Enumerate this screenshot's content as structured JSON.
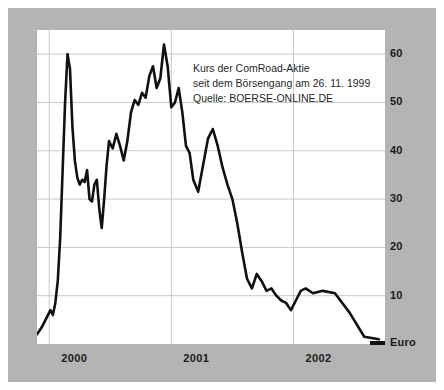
{
  "figure": {
    "frame_color": "#b4b4b4",
    "plot_bg": "#ffffff",
    "line_color": "#111111",
    "grid_color": "#c9c9c9"
  },
  "annotation": {
    "line1": "Kurs der ComRoad-Aktie",
    "line2": "seit dem Börsengang am 26. 11. 1999",
    "line3": "Quelle: BOERSE-ONLINE.DE"
  },
  "axis": {
    "y_unit_label": "Euro",
    "y_ticks": [
      "60",
      "50",
      "40",
      "30",
      "20",
      "10"
    ],
    "x_ticks": [
      "2000",
      "2001",
      "2002"
    ]
  },
  "chart_data": {
    "type": "line",
    "title": "Kurs der ComRoad-Aktie",
    "subtitle": "seit dem Börsengang am 26. 11. 1999",
    "source": "Quelle: BOERSE-ONLINE.DE",
    "xlabel": "",
    "ylabel": "Euro",
    "ylim": [
      0,
      65
    ],
    "yticks": [
      10,
      20,
      30,
      40,
      50,
      60
    ],
    "xlim": [
      1999.9,
      2002.75
    ],
    "xticks": [
      2000,
      2001,
      2002
    ],
    "xtick_labels": [
      "2000",
      "2001",
      "2002"
    ],
    "grid": true,
    "legend": false,
    "series": [
      {
        "name": "ComRoad",
        "x": [
          1999.9,
          1999.94,
          1999.98,
          2000.01,
          2000.03,
          2000.05,
          2000.07,
          2000.09,
          2000.11,
          2000.13,
          2000.15,
          2000.17,
          2000.19,
          2000.21,
          2000.23,
          2000.25,
          2000.27,
          2000.29,
          2000.31,
          2000.33,
          2000.35,
          2000.37,
          2000.39,
          2000.41,
          2000.43,
          2000.45,
          2000.47,
          2000.49,
          2000.52,
          2000.55,
          2000.58,
          2000.61,
          2000.64,
          2000.67,
          2000.7,
          2000.73,
          2000.76,
          2000.79,
          2000.82,
          2000.85,
          2000.88,
          2000.91,
          2000.94,
          2000.97,
          2001.0,
          2001.03,
          2001.06,
          2001.09,
          2001.12,
          2001.15,
          2001.18,
          2001.22,
          2001.26,
          2001.3,
          2001.34,
          2001.38,
          2001.42,
          2001.46,
          2001.5,
          2001.54,
          2001.58,
          2001.62,
          2001.66,
          2001.7,
          2001.74,
          2001.78,
          2001.82,
          2001.86,
          2001.9,
          2001.94,
          2001.98,
          2002.02,
          2002.06,
          2002.1,
          2002.16,
          2002.24,
          2002.34,
          2002.46,
          2002.58,
          2002.7
        ],
        "y": [
          2.0,
          3.5,
          5.5,
          7.0,
          6.0,
          8.5,
          13.0,
          22.0,
          36.0,
          50.0,
          60.0,
          57.0,
          45.0,
          38.0,
          34.5,
          33.0,
          34.0,
          33.5,
          36.0,
          30.0,
          29.5,
          33.0,
          34.0,
          28.0,
          24.0,
          30.0,
          37.0,
          42.0,
          40.5,
          43.5,
          41.0,
          38.0,
          42.0,
          48.0,
          50.5,
          49.5,
          52.0,
          51.0,
          55.5,
          57.5,
          53.0,
          55.0,
          62.0,
          57.5,
          49.0,
          50.0,
          53.0,
          48.0,
          41.0,
          39.5,
          34.0,
          31.5,
          37.0,
          42.5,
          44.5,
          41.0,
          36.5,
          33.0,
          30.0,
          25.0,
          19.0,
          13.5,
          11.5,
          14.5,
          13.0,
          11.0,
          11.5,
          10.0,
          9.0,
          8.5,
          7.0,
          9.0,
          11.0,
          11.5,
          10.5,
          11.0,
          10.5,
          6.5,
          1.5,
          1.0
        ]
      }
    ],
    "annotations": [
      {
        "text": "Kurs der ComRoad-Aktie",
        "x": 2000.6,
        "y": 62
      },
      {
        "text": "seit dem Börsengang am 26. 11. 1999",
        "x": 2000.6,
        "y": 58
      },
      {
        "text": "Quelle: BOERSE-ONLINE.DE",
        "x": 2000.6,
        "y": 54
      }
    ]
  }
}
